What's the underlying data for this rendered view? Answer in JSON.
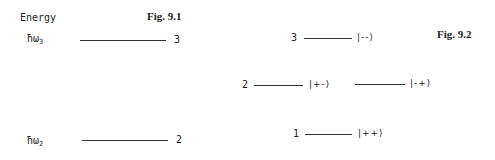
{
  "fig1": {
    "title": "Fig. 9.1",
    "axis_label": "Energy",
    "levels": [
      {
        "energy_symbol": "ħω",
        "subscript": "3",
        "label": "3"
      },
      {
        "energy_symbol": "ħω",
        "subscript": "2",
        "label": "2"
      }
    ]
  },
  "fig2": {
    "title": "Fig. 9.2",
    "levels": [
      {
        "label": "3",
        "states": [
          "|--⟩"
        ]
      },
      {
        "label": "2",
        "states": [
          "|+-⟩",
          "|-+⟩"
        ]
      },
      {
        "label": "1",
        "states": [
          "|++⟩"
        ]
      }
    ]
  },
  "colors": {
    "line": "#333333",
    "text": "#222222",
    "background": "#ffffff"
  }
}
